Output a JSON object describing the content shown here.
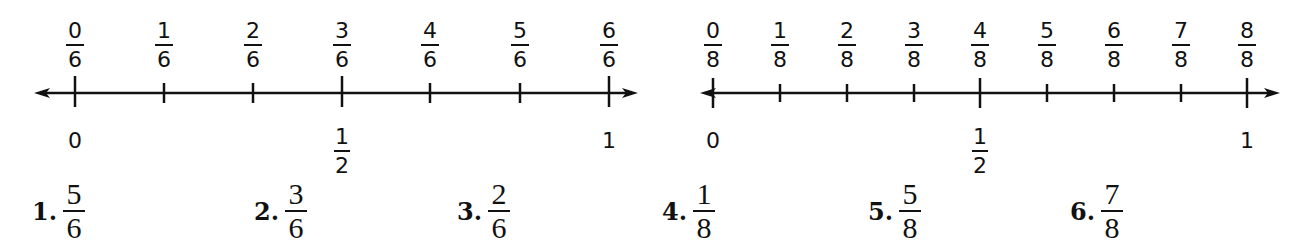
{
  "number_lines": [
    {
      "id": "sixths",
      "labels": [
        {
          "num": "0",
          "den": "6"
        },
        {
          "num": "1",
          "den": "6"
        },
        {
          "num": "2",
          "den": "6"
        },
        {
          "num": "3",
          "den": "6"
        },
        {
          "num": "4",
          "den": "6"
        },
        {
          "num": "5",
          "den": "6"
        },
        {
          "num": "6",
          "den": "6"
        }
      ],
      "below": {
        "zero": "0",
        "half_num": "1",
        "half_den": "2",
        "one": "1"
      }
    },
    {
      "id": "eighths",
      "labels": [
        {
          "num": "0",
          "den": "8"
        },
        {
          "num": "1",
          "den": "8"
        },
        {
          "num": "2",
          "den": "8"
        },
        {
          "num": "3",
          "den": "8"
        },
        {
          "num": "4",
          "den": "8"
        },
        {
          "num": "5",
          "den": "8"
        },
        {
          "num": "6",
          "den": "8"
        },
        {
          "num": "7",
          "den": "8"
        },
        {
          "num": "8",
          "den": "8"
        }
      ],
      "below": {
        "zero": "0",
        "half_num": "1",
        "half_den": "2",
        "one": "1"
      }
    }
  ],
  "problems": [
    {
      "label": "1.",
      "num": "5",
      "den": "6"
    },
    {
      "label": "2.",
      "num": "3",
      "den": "6"
    },
    {
      "label": "3.",
      "num": "2",
      "den": "6"
    },
    {
      "label": "4.",
      "num": "1",
      "den": "8"
    },
    {
      "label": "5.",
      "num": "5",
      "den": "8"
    },
    {
      "label": "6.",
      "num": "7",
      "den": "8"
    }
  ]
}
